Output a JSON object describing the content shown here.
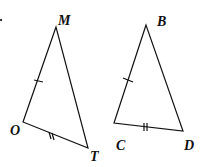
{
  "figure": {
    "triangles": [
      {
        "name": "MOT",
        "vertices": {
          "M": [
            56,
            27
          ],
          "O": [
            23,
            122
          ],
          "T": [
            88,
            148
          ]
        },
        "marks": {
          "MO": 1,
          "OT": 2
        }
      },
      {
        "name": "BCD",
        "vertices": {
          "B": [
            146,
            25
          ],
          "C": [
            114,
            123
          ],
          "D": [
            183,
            131
          ]
        },
        "marks": {
          "BC": 1,
          "CD": 2
        }
      }
    ],
    "labels": {
      "M": "M",
      "O": "O",
      "T": "T",
      "B": "B",
      "C": "C",
      "D": "D"
    },
    "stroke_color": "#111111"
  }
}
